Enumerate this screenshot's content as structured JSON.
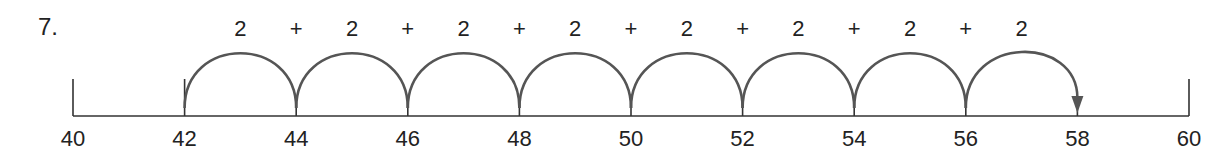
{
  "problem": {
    "number_label": "7.",
    "start": 40,
    "end": 60,
    "ticks": [
      40,
      42,
      44,
      46,
      48,
      50,
      52,
      54,
      56,
      58,
      60
    ],
    "labeled_ticks": [
      "40",
      "42",
      "44",
      "46",
      "48",
      "50",
      "52",
      "54",
      "56",
      "58",
      "60"
    ],
    "tall_ticks": [
      40,
      42,
      60
    ],
    "jump_start": 42,
    "jump_size": 2,
    "jump_count": 8,
    "jump_labels": [
      "2",
      "2",
      "2",
      "2",
      "2",
      "2",
      "2",
      "2"
    ],
    "operator_labels": [
      "+",
      "+",
      "+",
      "+",
      "+",
      "+",
      "+"
    ],
    "result": 58,
    "colors": {
      "line": "#333333",
      "arc": "#555555",
      "text": "#222222"
    }
  }
}
